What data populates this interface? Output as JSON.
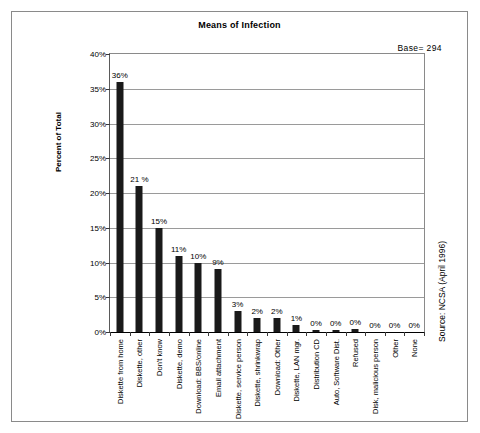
{
  "figure": {
    "title": "Means of Infection",
    "base_annotation": "Base=  294",
    "source_note": "Source: NCSA (April 1996)"
  },
  "chart_data": {
    "type": "bar",
    "title": "Means of Infection",
    "xlabel": "",
    "ylabel": "Percent of Total",
    "ylim": [
      0,
      40
    ],
    "ytick_labels": [
      "0%",
      "5%",
      "10%",
      "15%",
      "20%",
      "25%",
      "30%",
      "35%",
      "40%"
    ],
    "ytick_values": [
      0,
      5,
      10,
      15,
      20,
      25,
      30,
      35,
      40
    ],
    "grid": "horizontal",
    "legend": "none",
    "annotations": [
      "Base=  294",
      "Source: NCSA (April 1996)"
    ],
    "categories": [
      "Diskette from home",
      "Diskette, other",
      "Don't know",
      "Diskette, demo",
      "Download: BBS/online",
      "Email attachment",
      "Diskette, service person",
      "Diskette, shrinkwrap",
      "Download: Other",
      "Diskette, LAN mgr.",
      "Distribution CD",
      "Auto, Software Dist.",
      "Refused",
      "Disk, malicious person",
      "Other",
      "None"
    ],
    "values": [
      36,
      21,
      15,
      11,
      10,
      9,
      3,
      2,
      2,
      1,
      0.3,
      0.3,
      0.4,
      0,
      0,
      0
    ],
    "value_labels": [
      "36%",
      "21 %",
      "15%",
      "11%",
      "10%",
      "9%",
      "3%",
      "2%",
      "2%",
      "1%",
      "0%",
      "0%",
      "0%",
      "0%",
      "0%",
      "0%"
    ]
  }
}
